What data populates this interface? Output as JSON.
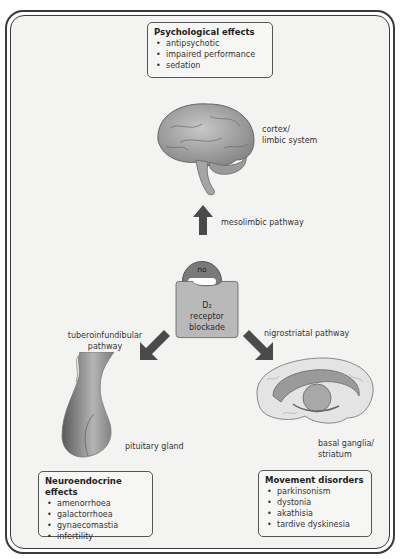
{
  "diagram": {
    "psychological": {
      "title": "Psychological effects",
      "items": [
        "antipsychotic",
        "impaired performance",
        "sedation"
      ]
    },
    "cortex_label": "cortex/\nlimbic system",
    "cortex_label_line1": "cortex/",
    "cortex_label_line2": "limbic system",
    "mesolimbic_label": "mesolimbic pathway",
    "no_entry": {
      "top": "no",
      "bottom": "entry"
    },
    "receptor": {
      "line1": "D₂",
      "line2": "receptor",
      "line3": "blockade"
    },
    "tuberoinfundibular_line1": "tuberoinfundibular",
    "tuberoinfundibular_line2": "pathway",
    "nigrostriatal_label": "nigrostriatal pathway",
    "pituitary_label": "pituitary gland",
    "basal_line1": "basal ganglia/",
    "basal_line2": "striatum",
    "neuroendocrine": {
      "title": "Neuroendocrine effects",
      "items": [
        "amenorrhoea",
        "galactorrhoea",
        "gynaecomastia",
        "infertility"
      ]
    },
    "movement": {
      "title": "Movement disorders",
      "items": [
        "parkinsonism",
        "dystonia",
        "akathisia",
        "tardive dyskinesia"
      ]
    },
    "colors": {
      "background": "#f3f3f2",
      "frame": "#3a3a3a",
      "arrow": "#4a4a4a",
      "receptor_fill": "#b9b9b9",
      "no_entry_fill": "#7a7a7a"
    }
  }
}
